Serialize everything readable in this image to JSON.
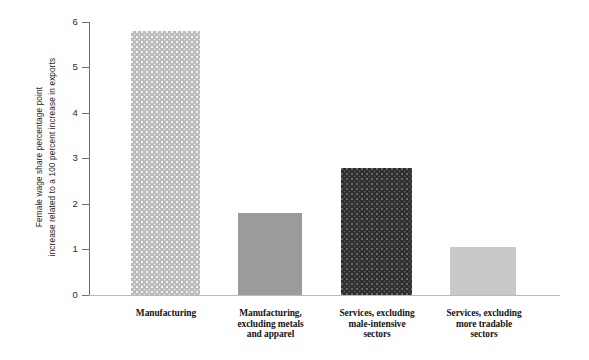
{
  "chart_data": {
    "type": "bar",
    "title": "",
    "xlabel": "",
    "ylabel": "Female wage share percentage point increase related to a 100 percent increase in exports",
    "ylabel_line1": "Female wage share percentage point",
    "ylabel_line2": "increase related to a 100 percent increase in exports",
    "ylim": [
      0,
      6
    ],
    "yticks": [
      "0",
      "1",
      "2",
      "3",
      "4",
      "5",
      "6"
    ],
    "ytick_values": [
      0,
      1,
      2,
      3,
      4,
      5,
      6
    ],
    "grid": false,
    "legend": "none",
    "categories": [
      "Manufacturing",
      "Manufacturing, excluding metals and apparel",
      "Services, excluding male-intensive sectors",
      "Services, excluding more tradable sectors"
    ],
    "category_lines": [
      [
        "Manufacturing"
      ],
      [
        "Manufacturing,",
        "excluding metals",
        "and apparel"
      ],
      [
        "Services, excluding",
        "male-intensive",
        "sectors"
      ],
      [
        "Services, excluding",
        "more tradable",
        "sectors"
      ]
    ],
    "values": [
      5.8,
      1.8,
      2.8,
      1.05
    ],
    "bar_styles": [
      "light-dotted",
      "medium-solid",
      "dark-dotted",
      "light-solid"
    ],
    "colors": {
      "bar1": "#b9b9b9",
      "bar2": "#9b9b9b",
      "bar3": "#2e2e2e",
      "bar4": "#c9c9c9",
      "axis": "#6f6f6f",
      "baseline": "#b9b9b9",
      "text": "#1a1a1a",
      "background": "#ffffff"
    }
  }
}
